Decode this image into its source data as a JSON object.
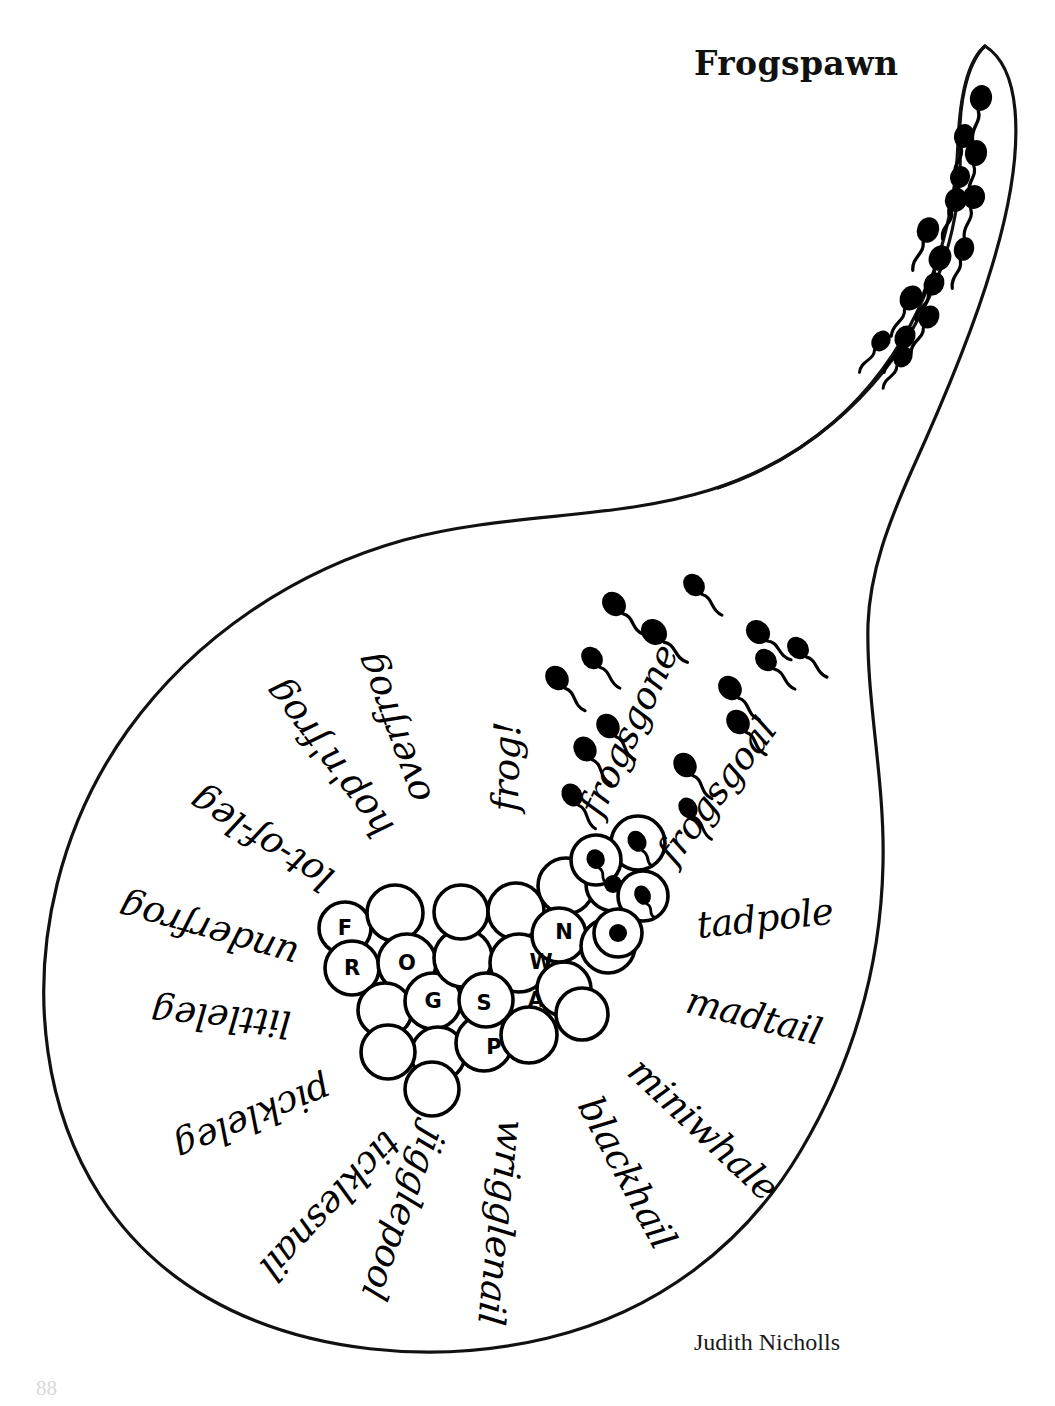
{
  "poem": {
    "title": "Frogspawn",
    "author": "Judith Nicholls",
    "page_number": "88",
    "shape": "frogspawn-blob-with-tail",
    "center_word": "FROGSPAWN",
    "center_letters": [
      "F",
      "R",
      "O",
      "G",
      "S",
      "P",
      "A",
      "W",
      "N"
    ],
    "words": [
      {
        "text": "overfrog",
        "rotation": 250
      },
      {
        "text": "hop'n'frog",
        "rotation": 233
      },
      {
        "text": "lot-of-leg",
        "rotation": 212
      },
      {
        "text": "underfrog",
        "rotation": 196
      },
      {
        "text": "littleleg",
        "rotation": 185
      },
      {
        "text": "pickleleg",
        "rotation": 158
      },
      {
        "text": "ticklesnail",
        "rotation": 133
      },
      {
        "text": "jigglepool",
        "rotation": 110
      },
      {
        "text": "wrigglenail",
        "rotation": 96
      },
      {
        "text": "blackhail",
        "rotation": 62
      },
      {
        "text": "miniwhale",
        "rotation": 43
      },
      {
        "text": "madtail",
        "rotation": 14
      },
      {
        "text": "tadpole",
        "rotation": 354
      },
      {
        "text": "frogsgoal",
        "rotation": 307
      },
      {
        "text": "frogsgone",
        "rotation": 295
      },
      {
        "text": "frog!",
        "rotation": 272
      }
    ]
  },
  "colors": {
    "ink": "#000000",
    "paper": "#ffffff",
    "outline": "#111111"
  }
}
